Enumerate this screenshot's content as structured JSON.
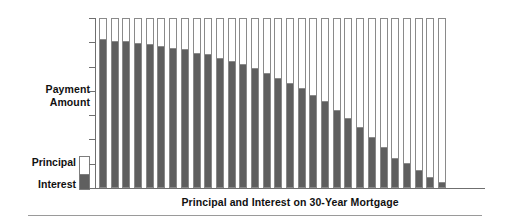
{
  "chart_data": {
    "type": "bar",
    "title": "",
    "subtitle": "",
    "xlabel": "Principal and Interest on 30-Year Mortgage",
    "ylabel": "Payment Amount",
    "stacked": true,
    "grid": false,
    "legend_position": "left",
    "axis_tick_labels": [],
    "y_tick_count": 8,
    "ylim": [
      0,
      100
    ],
    "note": "Level total payment each year; interest share declines, principal share grows.",
    "categories": [
      "1",
      "2",
      "3",
      "4",
      "5",
      "6",
      "7",
      "8",
      "9",
      "10",
      "11",
      "12",
      "13",
      "14",
      "15",
      "16",
      "17",
      "18",
      "19",
      "20",
      "21",
      "22",
      "23",
      "24",
      "25",
      "26",
      "27",
      "28",
      "29",
      "30"
    ],
    "series": [
      {
        "name": "Interest",
        "color": "#5f5f5f",
        "values": [
          88,
          87,
          87,
          86,
          85,
          84,
          83,
          82,
          80,
          79,
          77,
          75,
          73,
          71,
          68,
          65,
          62,
          59,
          55,
          51,
          46,
          41,
          36,
          30,
          24,
          17,
          14,
          10,
          6,
          3
        ]
      },
      {
        "name": "Principal",
        "color": "#ffffff",
        "values": [
          12,
          13,
          13,
          14,
          15,
          16,
          17,
          18,
          20,
          21,
          23,
          25,
          27,
          29,
          32,
          35,
          38,
          41,
          45,
          49,
          54,
          59,
          64,
          70,
          76,
          83,
          86,
          90,
          94,
          97
        ]
      }
    ]
  },
  "legend": {
    "principal_label": "Principal",
    "interest_label": "Interest"
  },
  "axes": {
    "y_label_line1": "Payment",
    "y_label_line2": "Amount",
    "x_label": "Principal and Interest on 30-Year Mortgage"
  },
  "colors": {
    "interest": "#5f5f5f",
    "principal": "#ffffff",
    "axis": "#6f6f6f",
    "bar_outline": "#8a8a8a",
    "rule": "#9a9a9a"
  }
}
